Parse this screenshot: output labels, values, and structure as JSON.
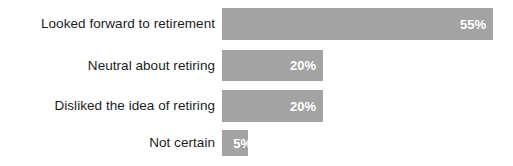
{
  "chart_data": {
    "type": "bar",
    "orientation": "horizontal",
    "title": "",
    "subtitle": "",
    "xlabel": "",
    "ylabel": "",
    "grid": false,
    "legend": null,
    "axis_visible": false,
    "xlim": [
      0,
      55
    ],
    "categories": [
      "Looked forward to retirement",
      "Neutral about retiring",
      "Disliked the idea of retiring",
      "Not certain"
    ],
    "values": [
      55,
      20,
      20,
      5
    ],
    "data_labels": [
      "55%",
      "20%",
      "20%",
      "5%"
    ],
    "bar_color": "#a3a3a3",
    "label_color": "#1c1c1c",
    "value_label_color": "#ffffff",
    "background_color": "#ffffff",
    "bars": [
      {
        "category": "Looked forward to retirement",
        "value": 55,
        "label": "55%",
        "width_px": 271,
        "overflow": false
      },
      {
        "category": "Neutral about retiring",
        "value": 20,
        "label": "20%",
        "width_px": 101,
        "overflow": false
      },
      {
        "category": "Disliked the idea of retiring",
        "value": 20,
        "label": "20%",
        "width_px": 101,
        "overflow": false
      },
      {
        "category": "Not certain",
        "value": 5,
        "label": "5%",
        "width_px": 26,
        "overflow": true
      }
    ]
  }
}
